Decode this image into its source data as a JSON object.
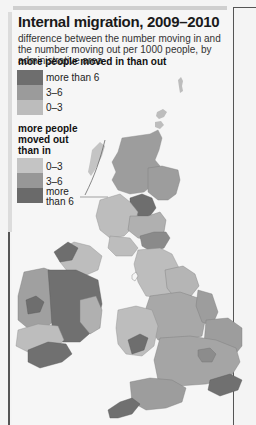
{
  "figure": {
    "title": "Internal migration, 2009–2010",
    "subtitle": "difference between the number moving in and the number moving out per 1000 people, by administrative area"
  },
  "legend": {
    "gain_heading": "more people moved in than out",
    "gain_items": [
      {
        "label": "more than 6",
        "color": "#6e6e6e"
      },
      {
        "label": "3–6",
        "color": "#9b9b9b"
      },
      {
        "label": "0–3",
        "color": "#bcbcbc"
      }
    ],
    "loss_heading_lines": [
      "more people",
      "moved out",
      "than in"
    ],
    "loss_items": [
      {
        "label": "0–3",
        "color": "#c4c4c4"
      },
      {
        "label": "3–6",
        "color": "#979797"
      },
      {
        "label_lines": [
          "more",
          "than 6"
        ],
        "color": "#6a6a6a"
      }
    ]
  },
  "map": {
    "regions": [
      "Great Britain",
      "Ireland",
      "Northern Ireland",
      "Shetland",
      "Orkney",
      "Western Isles"
    ],
    "colors": {
      "land_light": "#bdbdbd",
      "land_mid": "#9d9d9d",
      "land_dark": "#707070",
      "border": "#7a7a7a",
      "background": "#f6f6f6"
    }
  }
}
